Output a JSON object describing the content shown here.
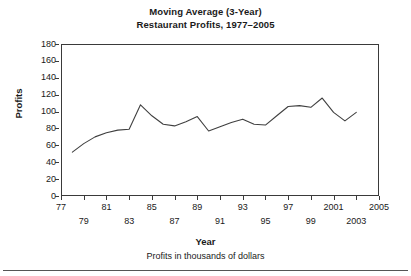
{
  "chart_data": {
    "type": "line",
    "title": "Moving Average (3-Year)\nRestaurant Profits, 1977–2005",
    "title_line1": "Moving Average (3-Year)",
    "title_line2": "Restaurant Profits, 1977–2005",
    "xlabel": "Year",
    "ylabel": "Profits",
    "footnote": "Profits in thousands of dollars",
    "grid": false,
    "legend": "none",
    "xlim": [
      1977,
      2005
    ],
    "ylim": [
      0,
      180
    ],
    "y_ticks": [
      180,
      160,
      140,
      120,
      100,
      80,
      60,
      40,
      20,
      0
    ],
    "x_ticks": [
      1977,
      1979,
      1981,
      1983,
      1985,
      1987,
      1989,
      1991,
      1993,
      1995,
      1997,
      1999,
      2001,
      2003,
      2005
    ],
    "x_tick_labels_row1": [
      "77",
      "81",
      "85",
      "89",
      "93",
      "97",
      "2001",
      "2005"
    ],
    "x_tick_labels_row1_years": [
      1977,
      1981,
      1985,
      1989,
      1993,
      1997,
      2001,
      2005
    ],
    "x_tick_labels_row2": [
      "79",
      "83",
      "87",
      "91",
      "95",
      "99",
      "2003"
    ],
    "x_tick_labels_row2_years": [
      1979,
      1983,
      1987,
      1991,
      1995,
      1999,
      2003
    ],
    "line_color": "#404040",
    "series": [
      {
        "name": "3-Year Moving Average of Restaurant Profits",
        "x": [
          1978,
          1979,
          1980,
          1981,
          1982,
          1983,
          1984,
          1985,
          1986,
          1987,
          1988,
          1989,
          1990,
          1991,
          1992,
          1993,
          1994,
          1995,
          1996,
          1997,
          1998,
          1999,
          2000,
          2001,
          2002,
          2003
        ],
        "values": [
          52,
          62,
          70,
          75,
          78,
          79,
          108,
          95,
          85,
          83,
          88,
          94,
          77,
          82,
          87,
          91,
          85,
          84,
          95,
          106,
          107,
          105,
          116,
          99,
          89,
          99
        ]
      }
    ]
  }
}
